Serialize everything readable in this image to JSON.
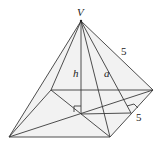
{
  "diagram": {
    "type": "square pyramid",
    "labels": {
      "apex": "V",
      "height": "h",
      "slant_height": "a",
      "lateral_edge": "5",
      "base_edge": "5"
    },
    "vertices": {
      "V": [
        81,
        21
      ],
      "back_left": [
        51,
        90
      ],
      "back_right": [
        153,
        90
      ],
      "front_left": [
        9,
        137
      ],
      "front_right": [
        110,
        137
      ],
      "center": [
        81,
        114
      ],
      "right_edge_mid": [
        131,
        113
      ]
    }
  }
}
